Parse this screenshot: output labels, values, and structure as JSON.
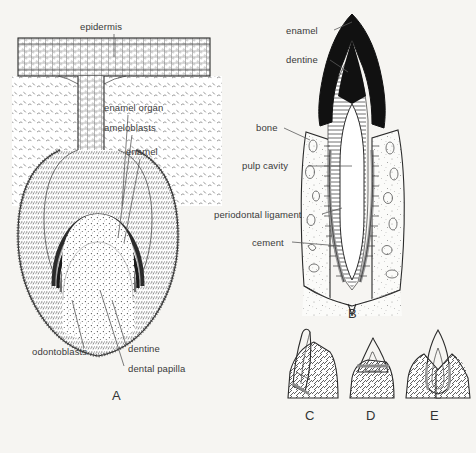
{
  "figure": {
    "title_visible": false,
    "background_color": "#f6f5f2",
    "ink_color": "#2b2b2b",
    "label_color": "#3a3a3a",
    "panels": [
      {
        "letter": "A",
        "name": "developing-tooth-germ",
        "labels": [
          "epidermis",
          "enamel organ",
          "ameloblasts",
          "enamel",
          "odontoblasts",
          "dentine",
          "dental papilla"
        ]
      },
      {
        "letter": "B",
        "name": "mature-tooth-in-socket",
        "labels": [
          "enamel",
          "dentine",
          "bone",
          "pulp cavity",
          "periodontal ligament",
          "cement"
        ]
      },
      {
        "letter": "C",
        "name": "tooth-attachment-acrodont",
        "labels": []
      },
      {
        "letter": "D",
        "name": "tooth-attachment-pleurodont",
        "labels": []
      },
      {
        "letter": "E",
        "name": "tooth-attachment-thecodont",
        "labels": []
      }
    ]
  },
  "panel_a": {
    "letter": "A",
    "epidermis": "epidermis",
    "enamel_organ": "enamel organ",
    "ameloblasts": "ameloblasts",
    "enamel": "enamel",
    "odontoblasts": "odontoblasts",
    "dentine": "dentine",
    "dental_papilla": "dental papilla"
  },
  "panel_b": {
    "letter": "B",
    "enamel": "enamel",
    "dentine": "dentine",
    "bone": "bone",
    "pulp_cavity": "pulp cavity",
    "periodontal_ligament": "periodontal ligament",
    "cement": "cement"
  },
  "panel_c": {
    "letter": "C"
  },
  "panel_d": {
    "letter": "D"
  },
  "panel_e": {
    "letter": "E"
  }
}
